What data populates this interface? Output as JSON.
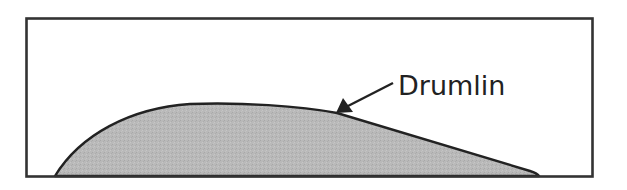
{
  "diagram": {
    "label": "Drumlin",
    "colors": {
      "frame": "#333333",
      "outline": "#222222",
      "fill": "#b8b8b8",
      "background": "#ffffff",
      "text": "#222222"
    },
    "elements": [
      {
        "type": "frame",
        "description": "rectangular border"
      },
      {
        "type": "landform",
        "name": "drumlin",
        "description": "asymmetric elongated hill, steep stoss side on left, gentle lee slope on right"
      },
      {
        "type": "arrow",
        "description": "pointer from label to hill outline"
      },
      {
        "type": "text",
        "value": "Drumlin"
      }
    ]
  }
}
